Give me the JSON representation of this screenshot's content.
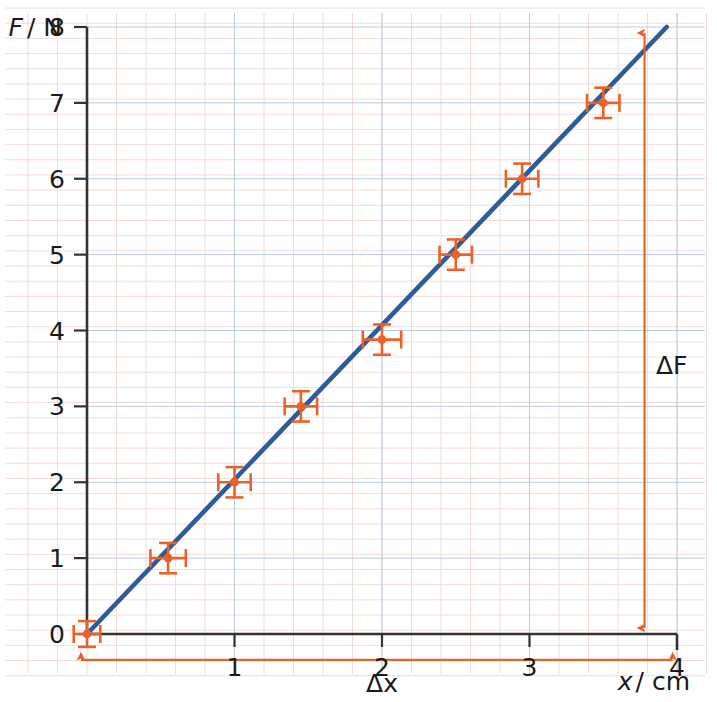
{
  "chart_data": {
    "type": "scatter",
    "title": "",
    "subtitle": "",
    "xlabel": "x/cm",
    "ylabel": "F/N",
    "xlim": [
      0,
      4
    ],
    "ylim": [
      0,
      8
    ],
    "grid": true,
    "grid_major_step_x": 1,
    "grid_major_step_y": 1,
    "grid_minor_step_x": 0.2,
    "grid_minor_step_y": 0.2,
    "legend": "none",
    "x_tick_labels": [
      "1",
      "2",
      "3",
      "4"
    ],
    "x_tick_values": [
      1,
      2,
      3,
      4
    ],
    "y_tick_labels": [
      "0",
      "1",
      "2",
      "3",
      "4",
      "5",
      "6",
      "7",
      "8"
    ],
    "y_tick_values": [
      0,
      1,
      2,
      3,
      4,
      5,
      6,
      7,
      8
    ],
    "series": [
      {
        "name": "measured force vs extension",
        "marker": "dot-with-error-bars",
        "marker_color": "#e8622a",
        "points": [
          {
            "x": 0.0,
            "y": 0.0,
            "xerr": 0.09,
            "yerr": 0.17
          },
          {
            "x": 0.55,
            "y": 1.0,
            "xerr": 0.12,
            "yerr": 0.2
          },
          {
            "x": 1.0,
            "y": 2.0,
            "xerr": 0.11,
            "yerr": 0.2
          },
          {
            "x": 1.45,
            "y": 3.0,
            "xerr": 0.11,
            "yerr": 0.2
          },
          {
            "x": 2.0,
            "y": 3.88,
            "xerr": 0.13,
            "yerr": 0.2
          },
          {
            "x": 2.5,
            "y": 5.0,
            "xerr": 0.11,
            "yerr": 0.2
          },
          {
            "x": 2.95,
            "y": 6.0,
            "xerr": 0.11,
            "yerr": 0.2
          },
          {
            "x": 3.5,
            "y": 7.0,
            "xerr": 0.11,
            "yerr": 0.2
          }
        ]
      },
      {
        "name": "line of best fit",
        "marker": "none",
        "line_color": "#2e5c9a",
        "from": {
          "x": 0.0,
          "y": 0.0
        },
        "to": {
          "x": 3.93,
          "y": 8.0
        },
        "slope_N_per_cm": 2.04
      }
    ],
    "annotations": [
      {
        "name": "delta-F",
        "label": "ΔF",
        "orientation": "vertical",
        "arrow": "double",
        "color": "#e8622a",
        "at_x": 3.78,
        "from_y": 0.0,
        "to_y": 8.0,
        "label_x": 4.1,
        "label_y": 4.0
      },
      {
        "name": "delta-x",
        "label": "Δx",
        "orientation": "horizontal",
        "arrow": "double",
        "color": "#e8622a",
        "at_y": -0.34,
        "from_x": 0.0,
        "to_x": 3.93,
        "label_x": 2.0,
        "label_y": -0.72
      }
    ]
  },
  "labels": {
    "y_axis_title": "F/ N",
    "y_axis_title_var": "F",
    "y_axis_title_unit": "/ N",
    "x_axis_title_var": "x",
    "x_axis_title_unit": "/ cm",
    "delta_f": "ΔF",
    "delta_x": "Δx"
  },
  "colors": {
    "data_orange": "#e8622a",
    "fit_blue": "#2e5c9a",
    "axis_black": "#333333",
    "grid_major": "#b9cbe3",
    "grid_minor": "#f2dcd8",
    "text": "#1a1a1a",
    "background": "#ffffff"
  }
}
